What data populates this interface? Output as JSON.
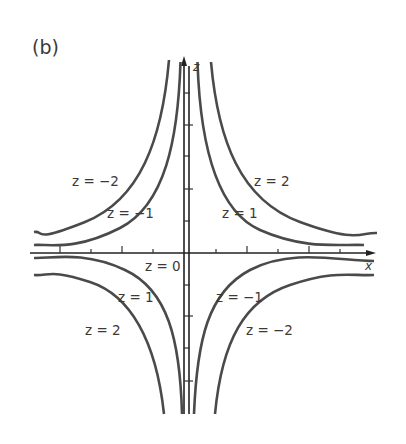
{
  "figure": {
    "panel_label": "(b)",
    "axes": {
      "x_label": "x",
      "z_label": "z"
    },
    "curve_labels": {
      "upper_left_outer": "z = −2",
      "upper_left_inner": "z = −1",
      "upper_right_outer": "z = 2",
      "upper_right_inner": "z = 1",
      "axis_level": "z = 0",
      "lower_left_inner": "z = 1",
      "lower_left_outer": "z = 2",
      "lower_right_inner": "z = −1",
      "lower_right_outer": "z = −2"
    }
  }
}
